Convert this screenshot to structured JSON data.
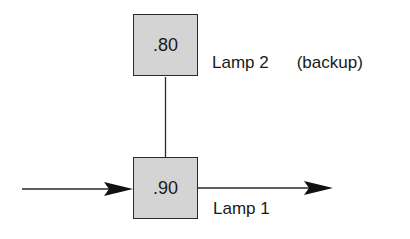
{
  "diagram": {
    "type": "reliability-block",
    "nodes": [
      {
        "id": "lamp2",
        "value": ".80",
        "label": "Lamp 2",
        "note": "(backup)"
      },
      {
        "id": "lamp1",
        "value": ".90",
        "label": "Lamp 1"
      }
    ],
    "edges": [
      {
        "from": "input",
        "to": "lamp1",
        "arrow": true
      },
      {
        "from": "lamp1",
        "to": "output",
        "arrow": true
      },
      {
        "from": "lamp2",
        "to": "lamp1",
        "arrow": false
      }
    ],
    "colors": {
      "box_fill": "#d4d4d4",
      "stroke": "#2a2a2a",
      "text": "#1a1a1a"
    }
  }
}
